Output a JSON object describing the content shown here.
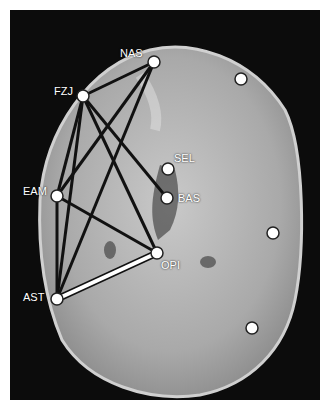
{
  "figure": {
    "landmarks": [
      {
        "id": "NAS",
        "label": "NAS",
        "x": 154,
        "y": 62,
        "lx": 120,
        "ly": 48
      },
      {
        "id": "FZJ",
        "label": "FZJ",
        "x": 83,
        "y": 96,
        "lx": 54,
        "ly": 86
      },
      {
        "id": "SEL",
        "label": "SEL",
        "x": 168,
        "y": 169,
        "lx": 174,
        "ly": 153
      },
      {
        "id": "BAS",
        "label": "BAS",
        "x": 167,
        "y": 198,
        "lx": 178,
        "ly": 193
      },
      {
        "id": "EAM",
        "label": "EAM",
        "x": 57,
        "y": 196,
        "lx": 23,
        "ly": 186
      },
      {
        "id": "OPI",
        "label": "OPI",
        "x": 157,
        "y": 253,
        "lx": 161,
        "ly": 260
      },
      {
        "id": "AST",
        "label": "AST",
        "x": 57,
        "y": 299,
        "lx": 23,
        "ly": 292
      },
      {
        "id": "P1",
        "label": "",
        "x": 241,
        "y": 79
      },
      {
        "id": "P2",
        "label": "",
        "x": 273,
        "y": 233
      },
      {
        "id": "P3",
        "label": "",
        "x": 252,
        "y": 328
      }
    ],
    "lines_black": [
      [
        "NAS",
        "FZJ"
      ],
      [
        "NAS",
        "EAM"
      ],
      [
        "NAS",
        "AST"
      ],
      [
        "FZJ",
        "EAM"
      ],
      [
        "FZJ",
        "AST"
      ],
      [
        "FZJ",
        "BAS"
      ],
      [
        "FZJ",
        "OPI"
      ],
      [
        "EAM",
        "AST"
      ],
      [
        "EAM",
        "OPI"
      ]
    ],
    "lines_white": [
      [
        "AST",
        "OPI"
      ]
    ],
    "colors": {
      "background": "#0c0c0c",
      "bone": "#b8b8b8",
      "marker": "#ffffff",
      "line": "#111111"
    }
  }
}
